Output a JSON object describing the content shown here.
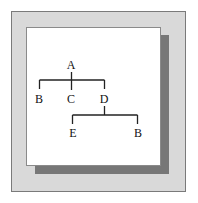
{
  "diagram": {
    "type": "tree",
    "nodes": {
      "root": "A",
      "child1": "B",
      "child2": "C",
      "child3": "D",
      "grandchild1": "E",
      "grandchild2": "B"
    },
    "edges": [
      [
        "A",
        "B"
      ],
      [
        "A",
        "C"
      ],
      [
        "A",
        "D"
      ],
      [
        "D",
        "E"
      ],
      [
        "D",
        "B"
      ]
    ],
    "colors": {
      "frame": "#d9d9d9",
      "shadow": "#777777",
      "card": "#ffffff",
      "lines": "#222222"
    }
  }
}
